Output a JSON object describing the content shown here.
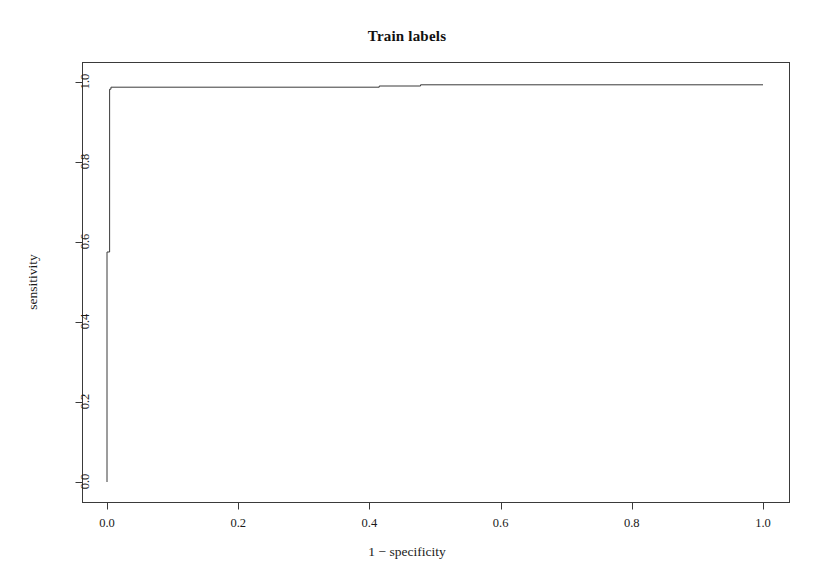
{
  "chart_data": {
    "type": "line",
    "title": "Train labels",
    "xlabel": "1 − specificity",
    "ylabel": "sensitivity",
    "xlim": [
      0,
      1
    ],
    "ylim": [
      0,
      1
    ],
    "grid": false,
    "legend": null,
    "legend_position": "none",
    "frame": "box",
    "line_color": "#3a3a3a",
    "line_width": 1,
    "x_ticks": [
      0.0,
      0.2,
      0.4,
      0.6,
      0.8,
      1.0
    ],
    "x_tick_labels": [
      "0.0",
      "0.2",
      "0.4",
      "0.6",
      "0.8",
      "1.0"
    ],
    "y_ticks": [
      0.0,
      0.2,
      0.4,
      0.6,
      0.8,
      1.0
    ],
    "y_tick_labels": [
      "0.0",
      "0.2",
      "0.4",
      "0.6",
      "0.8",
      "1.0"
    ],
    "series": [
      {
        "name": "ROC curve",
        "x": [
          0.0,
          0.0,
          0.004,
          0.004,
          0.006,
          0.006,
          0.415,
          0.415,
          0.478,
          0.478,
          1.0
        ],
        "y": [
          0.0,
          0.575,
          0.575,
          0.982,
          0.982,
          0.987,
          0.987,
          0.99,
          0.99,
          0.993,
          0.993
        ]
      }
    ],
    "annotations": []
  },
  "axes": {
    "x_title": "1 − specificity",
    "y_title": "sensitivity"
  },
  "header": {
    "title": "Train labels"
  }
}
